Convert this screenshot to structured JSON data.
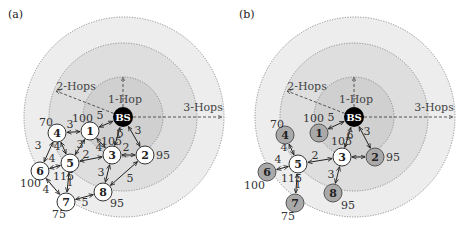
{
  "colors": {
    "ring_outer": "#ededed",
    "ring_middle": "#dedede",
    "ring_inner": "#d0d0d0",
    "node_white": "#ffffff",
    "node_gray": "#a9a9a9",
    "bs": "#000000",
    "edge": "#222222"
  },
  "hop_labels": {
    "one": "1-Hop",
    "two": "2-Hops",
    "three": "3-Hops"
  },
  "panels": [
    {
      "label": "(a)",
      "offset_x": 0,
      "bs": {
        "label": "BS",
        "x": 123,
        "y": 117
      },
      "nodes": [
        {
          "id": "1",
          "x": 90,
          "y": 131,
          "fill": "white",
          "value": "100",
          "vx": 72,
          "vy": 122
        },
        {
          "id": "2",
          "x": 145,
          "y": 155,
          "fill": "white",
          "value": "95",
          "vx": 156,
          "vy": 159
        },
        {
          "id": "3",
          "x": 112,
          "y": 155,
          "fill": "white",
          "value": "105",
          "vx": 101,
          "vy": 145
        },
        {
          "id": "4",
          "x": 57,
          "y": 133,
          "fill": "white",
          "value": "70",
          "vx": 39,
          "vy": 126
        },
        {
          "id": "5",
          "x": 70,
          "y": 163,
          "fill": "white",
          "value": "115",
          "vx": 53,
          "vy": 180
        },
        {
          "id": "6",
          "x": 40,
          "y": 171,
          "fill": "white",
          "value": "100",
          "vx": 20,
          "vy": 187
        },
        {
          "id": "7",
          "x": 66,
          "y": 202,
          "fill": "white",
          "value": "75",
          "vx": 52,
          "vy": 218
        },
        {
          "id": "8",
          "x": 103,
          "y": 192,
          "fill": "white",
          "value": "95",
          "vx": 110,
          "vy": 207
        }
      ],
      "edges": [
        {
          "from": "BS",
          "to": "1",
          "w": "5",
          "lx": 100,
          "ly": 119
        },
        {
          "from": "BS",
          "to": "3",
          "w": "6",
          "lx": 120,
          "ly": 137
        },
        {
          "from": "BS",
          "to": "2",
          "w": "3",
          "lx": 138,
          "ly": 134
        },
        {
          "from": "4",
          "to": "1",
          "w": "3",
          "lx": 70,
          "ly": 128
        },
        {
          "from": "4",
          "to": "5",
          "w": "4",
          "lx": 57,
          "ly": 150
        },
        {
          "from": "4",
          "to": "6",
          "w": "3",
          "lx": 38,
          "ly": 149
        },
        {
          "from": "1",
          "to": "5",
          "w": "3",
          "lx": 80,
          "ly": 148
        },
        {
          "from": "1",
          "to": "3",
          "w": "4",
          "lx": 99,
          "ly": 151
        },
        {
          "from": "5",
          "to": "3",
          "w": "2",
          "lx": 86,
          "ly": 158
        },
        {
          "from": "6",
          "to": "5",
          "w": "4",
          "lx": 52,
          "ly": 162
        },
        {
          "from": "3",
          "to": "2",
          "w": "2",
          "lx": 126,
          "ly": 151
        },
        {
          "from": "3",
          "to": "8",
          "w": "3",
          "lx": 101,
          "ly": 176
        },
        {
          "from": "8",
          "to": "2",
          "w": "5",
          "lx": 130,
          "ly": 182
        },
        {
          "from": "5",
          "to": "7",
          "w": "1",
          "lx": 70,
          "ly": 186
        },
        {
          "from": "6",
          "to": "7",
          "w": "4",
          "lx": 46,
          "ly": 193
        },
        {
          "from": "7",
          "to": "8",
          "w": "5",
          "lx": 85,
          "ly": 206
        }
      ]
    },
    {
      "label": "(b)",
      "offset_x": 231,
      "bs": {
        "label": "BS",
        "x": 123,
        "y": 117
      },
      "nodes": [
        {
          "id": "1",
          "x": 88,
          "y": 133,
          "fill": "gray",
          "value": "100",
          "vx": 72,
          "vy": 122
        },
        {
          "id": "2",
          "x": 144,
          "y": 157,
          "fill": "gray",
          "value": "95",
          "vx": 155,
          "vy": 161
        },
        {
          "id": "3",
          "x": 111,
          "y": 157,
          "fill": "white",
          "value": "105",
          "vx": 100,
          "vy": 145
        },
        {
          "id": "4",
          "x": 54,
          "y": 135,
          "fill": "gray",
          "value": "70",
          "vx": 39,
          "vy": 128
        },
        {
          "id": "5",
          "x": 67,
          "y": 164,
          "fill": "white",
          "value": "115",
          "vx": 50,
          "vy": 182
        },
        {
          "id": "6",
          "x": 36,
          "y": 172,
          "fill": "gray",
          "value": "100",
          "vx": 13,
          "vy": 189
        },
        {
          "id": "7",
          "x": 64,
          "y": 203,
          "fill": "gray",
          "value": "75",
          "vx": 50,
          "vy": 220
        },
        {
          "id": "8",
          "x": 102,
          "y": 193,
          "fill": "gray",
          "value": "95",
          "vx": 110,
          "vy": 209
        }
      ],
      "edges": [
        {
          "from": "BS",
          "to": "1",
          "w": "5",
          "lx": 100,
          "ly": 121
        },
        {
          "from": "BS",
          "to": "3",
          "w": "6",
          "lx": 119,
          "ly": 139
        },
        {
          "from": "BS",
          "to": "2",
          "w": "3",
          "lx": 136,
          "ly": 135
        },
        {
          "from": "4",
          "to": "5",
          "w": "4",
          "lx": 53,
          "ly": 151
        },
        {
          "from": "5",
          "to": "3",
          "w": "2",
          "lx": 84,
          "ly": 159
        },
        {
          "from": "6",
          "to": "5",
          "w": "4",
          "lx": 47,
          "ly": 163
        },
        {
          "from": "3",
          "to": "2",
          "w": "",
          "lx": 0,
          "ly": 0
        },
        {
          "from": "3",
          "to": "8",
          "w": "3",
          "lx": 100,
          "ly": 178
        },
        {
          "from": "5",
          "to": "7",
          "w": "1",
          "lx": 67,
          "ly": 188
        }
      ]
    }
  ]
}
